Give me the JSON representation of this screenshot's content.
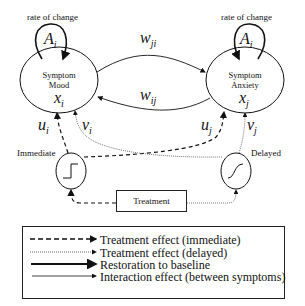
{
  "diagram": {
    "nodes": {
      "mood": {
        "line1": "Symptom",
        "line2": "Mood",
        "var": "x",
        "sub": "i"
      },
      "anxiety": {
        "line1": "Symptom",
        "line2": "Anxiety",
        "var": "x",
        "sub": "j"
      }
    },
    "self_loops": {
      "left": {
        "label": "rate of change",
        "var": "A",
        "sub": "i"
      },
      "right": {
        "label": "rate of change",
        "var": "A",
        "sub": "i"
      }
    },
    "interaction_edges": {
      "top": {
        "var": "w",
        "sub": "ji"
      },
      "bottom": {
        "var": "w",
        "sub": "ij"
      }
    },
    "inputs": {
      "u_i": {
        "var": "u",
        "sub": "i"
      },
      "v_i": {
        "var": "v",
        "sub": "i"
      },
      "u_j": {
        "var": "u",
        "sub": "j"
      },
      "v_j": {
        "var": "v",
        "sub": "j"
      }
    },
    "filters": {
      "immediate": {
        "label": "Immediate",
        "shape": "step-icon"
      },
      "delayed": {
        "label": "Delayed",
        "shape": "sigmoid-icon"
      }
    },
    "treatment": {
      "label": "Treatment"
    }
  },
  "legend": {
    "items": [
      {
        "style": "dashed",
        "label": "Treatment effect (immediate)"
      },
      {
        "style": "dotted",
        "label": "Treatment effect (delayed)"
      },
      {
        "style": "thick-solid",
        "label": "Restoration to baseline"
      },
      {
        "style": "thin-solid",
        "label": "Interaction effect (between symptoms)"
      }
    ]
  }
}
